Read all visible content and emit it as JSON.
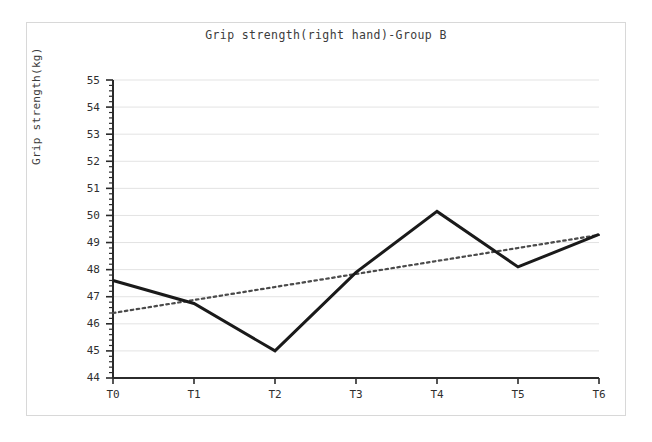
{
  "chart_data": {
    "type": "line",
    "title": "Grip strength(right hand)-Group B",
    "xlabel": "",
    "ylabel": "Grip strength(kg)",
    "categories": [
      "T0",
      "T1",
      "T2",
      "T3",
      "T4",
      "T5",
      "T6"
    ],
    "ylim": [
      44,
      55
    ],
    "xlim": [
      0,
      6
    ],
    "ytick_labels": [
      "55",
      "54",
      "53",
      "52",
      "51",
      "50",
      "49",
      "48",
      "47",
      "46",
      "45",
      "44"
    ],
    "ytick_values": [
      55,
      54,
      53,
      52,
      51,
      50,
      49,
      48,
      47,
      46,
      45,
      44
    ],
    "ytick_step": 1,
    "yminor_step": 0.2,
    "grid": "horizontal-only",
    "grid_color": "#e3e3e3",
    "legend": "none",
    "series": [
      {
        "name": "Grip strength (right hand)",
        "style": "solid",
        "color": "#1a1a1a",
        "width": 3,
        "values": [
          47.6,
          46.75,
          45.0,
          47.9,
          50.15,
          48.1,
          49.3
        ]
      },
      {
        "name": "Linear trend",
        "style": "dotted",
        "color": "#4a4a4a",
        "width": 2,
        "values": [
          46.4,
          46.88,
          47.36,
          47.84,
          48.32,
          48.8,
          49.28
        ]
      }
    ],
    "annotations": []
  },
  "figure": {
    "background_color": "#ffffff",
    "frame_color": "#d8d8d8",
    "axis_color": "#2b2b2b"
  }
}
